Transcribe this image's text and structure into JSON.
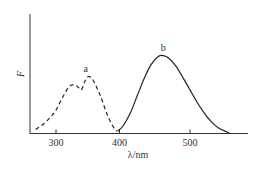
{
  "chart_data": {
    "type": "line",
    "title": "",
    "xlabel": "λ/nm",
    "ylabel": "F",
    "xlim": [
      260,
      580
    ],
    "ylim": [
      0,
      1.0
    ],
    "x_ticks": [
      300,
      400,
      500
    ],
    "y_ticks": [],
    "grid": false,
    "legend": "inline labels",
    "series": [
      {
        "name": "a",
        "style": "dashed",
        "note": "excitation spectrum",
        "x": [
          268,
          280,
          290,
          300,
          310,
          320,
          328,
          335,
          340,
          345,
          350,
          355,
          360,
          370,
          380,
          390,
          396
        ],
        "values": [
          0.04,
          0.1,
          0.17,
          0.26,
          0.4,
          0.52,
          0.55,
          0.52,
          0.49,
          0.58,
          0.64,
          0.63,
          0.58,
          0.42,
          0.22,
          0.07,
          0.02
        ]
      },
      {
        "name": "b",
        "style": "solid",
        "note": "emission spectrum",
        "x": [
          397,
          405,
          415,
          425,
          435,
          445,
          455,
          462,
          470,
          480,
          490,
          500,
          510,
          520,
          530,
          540,
          550,
          556
        ],
        "values": [
          0.02,
          0.08,
          0.22,
          0.42,
          0.62,
          0.78,
          0.87,
          0.88,
          0.85,
          0.76,
          0.63,
          0.49,
          0.35,
          0.23,
          0.13,
          0.06,
          0.02,
          0.0
        ]
      }
    ],
    "annotations": [
      {
        "text": "a",
        "x": 350,
        "y": 0.73
      },
      {
        "text": "b",
        "x": 462,
        "y": 0.97
      }
    ]
  },
  "labels": {
    "xlabel": "λ/nm",
    "ylabel": "F",
    "series_a": "a",
    "series_b": "b",
    "tick_300": "300",
    "tick_400": "400",
    "tick_500": "500"
  }
}
